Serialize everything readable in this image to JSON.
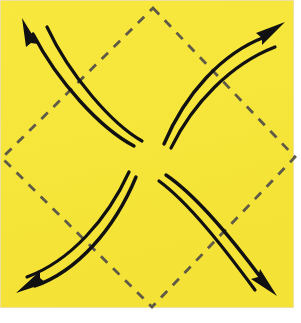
{
  "figure": {
    "kind": "geometry-diagram",
    "width": 301,
    "height": 323
  },
  "colors": {
    "page_background": "#ffffff",
    "tile_fill": "#F7E63A",
    "tile_fill_alt": "#F5E338",
    "dashed_stroke": "#5E5A47",
    "curve_stroke": "#111111",
    "tile_edge": "#EFE0A0"
  },
  "tile": {
    "x": 0,
    "y": 0,
    "width": 294,
    "height": 308
  },
  "diamond": {
    "label": "dashed-diamond",
    "stroke_width": 2.6,
    "dash_pattern": "9 8",
    "vertices": [
      {
        "name": "top",
        "x": 153,
        "y": 8
      },
      {
        "name": "right",
        "x": 295,
        "y": 157
      },
      {
        "name": "bottom",
        "x": 152,
        "y": 307
      },
      {
        "name": "left",
        "x": 2,
        "y": 158
      }
    ]
  },
  "center": {
    "x": 150,
    "y": 158
  },
  "arrow_groups": [
    {
      "name": "arrow-top-left",
      "direction": "up-left",
      "arrowhead": {
        "x": 24,
        "y": 22,
        "angle": -118
      },
      "outer_path": "M 31 32 C 60 78, 104 126, 132 144",
      "inner_path": "M 45 26 C 72 72, 112 122, 140 140"
    },
    {
      "name": "arrow-top-right",
      "direction": "up-right",
      "arrowhead": {
        "x": 277,
        "y": 28,
        "angle": -28
      },
      "outer_path": "M 266 36 C 224 52, 186 92, 164 142",
      "inner_path": "M 273 45 C 230 62, 192 100, 170 146"
    },
    {
      "name": "arrow-bottom-left",
      "direction": "down-left",
      "arrowhead": {
        "x": 24,
        "y": 290,
        "angle": 160
      },
      "outer_path": "M 34 287 C 76 272, 114 230, 136 176",
      "inner_path": "M 26 280 C 70 264, 108 222, 130 170"
    },
    {
      "name": "arrow-bottom-right",
      "direction": "down-right",
      "arrowhead": {
        "x": 272,
        "y": 291,
        "angle": 62
      },
      "outer_path": "M 265 283 C 234 240, 198 196, 166 174",
      "inner_path": "M 257 289 C 226 248, 190 202, 160 180"
    }
  ]
}
